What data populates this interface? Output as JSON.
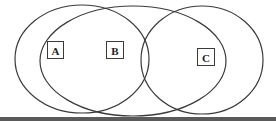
{
  "diagram": {
    "type": "venn",
    "stroke_color": "#3a3a3a",
    "sets": [
      {
        "id": "outer-left",
        "shape": "ellipse",
        "cx": 82,
        "cy": 59,
        "rx": 67,
        "ry": 54
      },
      {
        "id": "middle",
        "shape": "ellipse",
        "cx": 133,
        "cy": 61,
        "rx": 93,
        "ry": 55
      },
      {
        "id": "right",
        "shape": "ellipse",
        "cx": 202,
        "cy": 60,
        "rx": 61,
        "ry": 54
      }
    ],
    "labels": [
      {
        "text": "A",
        "x": 47,
        "y": 41,
        "w": 16,
        "h": 17
      },
      {
        "text": "B",
        "x": 106,
        "y": 41,
        "w": 17,
        "h": 17
      },
      {
        "text": "C",
        "x": 197,
        "y": 48,
        "w": 17,
        "h": 17
      }
    ]
  }
}
